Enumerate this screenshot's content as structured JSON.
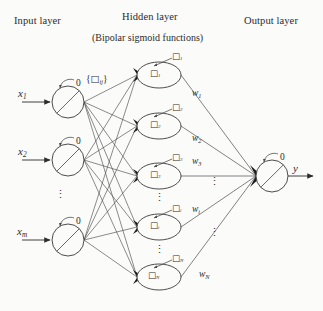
{
  "figure": {
    "type": "neural-network-diagram",
    "width": 323,
    "height": 311,
    "background_color": "#fbfbfa",
    "ink_color": "#2b2b2b"
  },
  "headers": {
    "input_layer": "Input layer",
    "hidden_layer": "Hidden layer",
    "hidden_layer_note": "(Bipolar sigmoid functions)",
    "output_layer": "Output layer"
  },
  "input_layer": {
    "node_count_visible": 3,
    "threshold_label": "0",
    "nodes": [
      {
        "signal": "x",
        "subscript": "1",
        "threshold": "0"
      },
      {
        "signal": "x",
        "subscript": "2",
        "threshold": "0"
      },
      {
        "signal": "x",
        "subscript": "m",
        "threshold": "0"
      }
    ],
    "ellipsis": "⋮"
  },
  "weights_input_to_hidden": {
    "label_open": "{",
    "label_symbol": "□",
    "label_subscript": "ij",
    "label_close": "}"
  },
  "hidden_layer": {
    "node_count_visible": 5,
    "nodes": [
      {
        "body_symbol": "□",
        "body_subscript": "1",
        "threshold_symbol": "□",
        "threshold_subscript": "1",
        "out_weight": "w",
        "out_weight_subscript": "1"
      },
      {
        "body_symbol": "□",
        "body_subscript": "2",
        "threshold_symbol": "□",
        "threshold_subscript": "2",
        "out_weight": "w",
        "out_weight_subscript": "2"
      },
      {
        "body_symbol": "□",
        "body_subscript": "3",
        "threshold_symbol": "□",
        "threshold_subscript": "3",
        "out_weight": "w",
        "out_weight_subscript": "3"
      },
      {
        "body_symbol": "□",
        "body_subscript": "i",
        "threshold_symbol": "□",
        "threshold_subscript": "i",
        "out_weight": "w",
        "out_weight_subscript": "i"
      },
      {
        "body_symbol": "□",
        "body_subscript": "N",
        "threshold_symbol": "□",
        "threshold_subscript": "N",
        "out_weight": "w",
        "out_weight_subscript": "N"
      }
    ],
    "ellipsis": "⋮"
  },
  "output_layer": {
    "threshold_label": "0",
    "output_signal": "y"
  }
}
